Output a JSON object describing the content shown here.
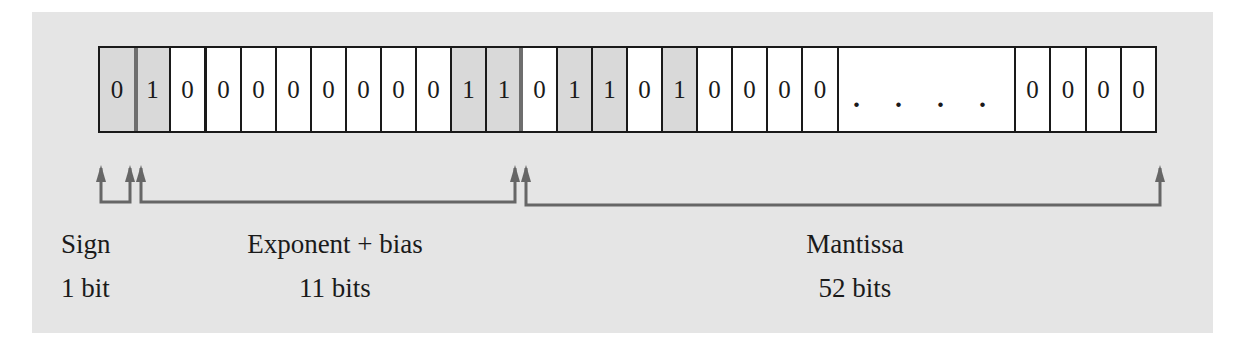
{
  "figure": {
    "bits": {
      "sign": [
        "0"
      ],
      "exponent": [
        "1",
        "0",
        "0",
        "0",
        "0",
        "0",
        "0",
        "0",
        "0",
        "1",
        "1"
      ],
      "mantissa_head": [
        "0",
        "1",
        "1",
        "0",
        "1",
        "0",
        "0",
        "0",
        "0"
      ],
      "ellipsis": ". . . .",
      "mantissa_tail": [
        "0",
        "0",
        "0",
        "0"
      ]
    },
    "fields": [
      {
        "name": "Sign",
        "size": "1 bit"
      },
      {
        "name": "Exponent + bias",
        "size": "11 bits"
      },
      {
        "name": "Mantissa",
        "size": "52 bits"
      }
    ],
    "colors": {
      "panel_bg": "#e5e5e5",
      "shaded_cell": "#d9d9d9",
      "plain_cell": "#ffffff",
      "border": "#1a1a1a",
      "arrow": "#666666",
      "field_divider": "#6e6e6e"
    }
  }
}
